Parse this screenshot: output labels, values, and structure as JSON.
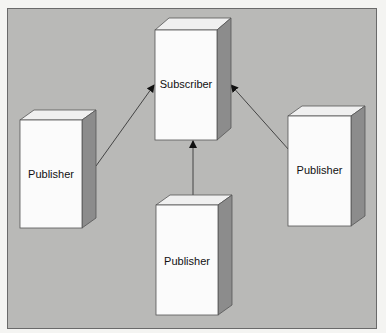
{
  "diagram": {
    "nodes": [
      {
        "id": "subscriber",
        "label": "Subscriber",
        "x": 155,
        "y": 30,
        "w": 62,
        "h": 110
      },
      {
        "id": "publisher-left",
        "label": "Publisher",
        "x": 20,
        "y": 120,
        "w": 62,
        "h": 108
      },
      {
        "id": "publisher-right",
        "label": "Publisher",
        "x": 288,
        "y": 113,
        "w": 62,
        "h": 112
      },
      {
        "id": "publisher-bottom",
        "label": "Publisher",
        "x": 156,
        "y": 205,
        "w": 62,
        "h": 110
      }
    ],
    "edges": [
      {
        "from": "publisher-left",
        "to": "subscriber"
      },
      {
        "from": "publisher-right",
        "to": "subscriber"
      },
      {
        "from": "publisher-bottom",
        "to": "subscriber"
      }
    ],
    "colors": {
      "background": "#b9b9b7",
      "front": "#fafafa",
      "top": "#eeeeee",
      "side": "#8a8a8a",
      "line": "#333333"
    }
  }
}
